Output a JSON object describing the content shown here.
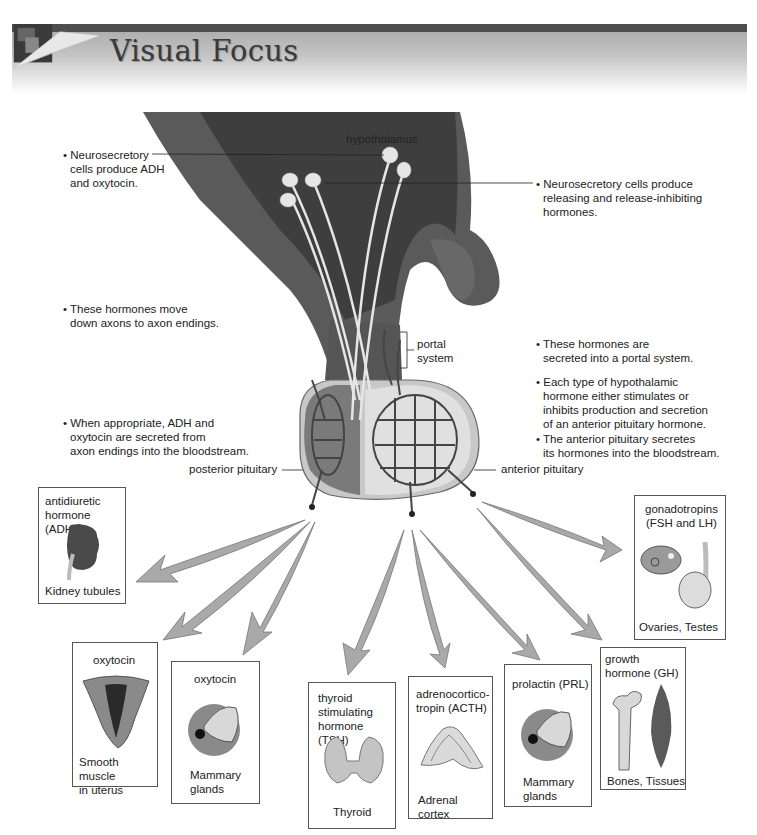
{
  "header": {
    "title": "Visual Focus",
    "colors": {
      "bar": "#4e4e4e",
      "gradient_top": "#a8a8a8",
      "title": "#3a3a3a"
    }
  },
  "diagram": {
    "structure_labels": {
      "hypothalamus": "hypothalamus",
      "portal_system_line1": "portal",
      "portal_system_line2": "system",
      "posterior_pituitary": "posterior pituitary",
      "anterior_pituitary": "anterior pituitary"
    },
    "annotations_left": [
      {
        "id": "neurosecretory-adh",
        "lines": [
          "• Neurosecretory",
          "cells produce ADH",
          "and oxytocin."
        ]
      },
      {
        "id": "move-down-axons",
        "lines": [
          "• These hormones move",
          "down axons to axon endings."
        ]
      },
      {
        "id": "adh-oxytocin-secreted",
        "lines": [
          "• When appropriate, ADH and",
          "oxytocin are secreted from",
          "axon endings into the bloodstream."
        ]
      }
    ],
    "annotations_right": [
      {
        "id": "neurosecretory-releasing",
        "lines": [
          "• Neurosecretory cells produce",
          "releasing and release-inhibiting",
          "hormones."
        ]
      },
      {
        "id": "portal-secretion",
        "lines": [
          "• These hormones are",
          "secreted into a portal system."
        ]
      },
      {
        "id": "stimulates-inhibits",
        "lines": [
          "• Each type of hypothalamic",
          "hormone either stimulates or",
          "inhibits production and secretion",
          "of an anterior pituitary hormone."
        ]
      },
      {
        "id": "anterior-secretes",
        "lines": [
          "• The anterior pituitary secretes",
          "its hormones into the bloodstream."
        ]
      }
    ],
    "colors": {
      "brain_tissue": "#5a5a5a",
      "brain_dark": "#3e3e3e",
      "gland_posterior": "#7a7a7a",
      "gland_anterior": "#d6d6d6",
      "vessels": "#444444",
      "arrow_fill": "#a9a9a9",
      "neuron": "#e6e6e6"
    }
  },
  "targets": [
    {
      "id": "adh",
      "hormone_lines": [
        "antidiuretic",
        "hormone (ADH)"
      ],
      "target_lines": [
        "Kidney tubules"
      ],
      "source": "posterior",
      "icon": "kidney-icon"
    },
    {
      "id": "oxytocin-uterus",
      "hormone_lines": [
        "oxytocin"
      ],
      "target_lines": [
        "Smooth muscle",
        "in uterus"
      ],
      "source": "posterior",
      "icon": "uterus-icon"
    },
    {
      "id": "oxytocin-mammary",
      "hormone_lines": [
        "oxytocin"
      ],
      "target_lines": [
        "Mammary",
        "glands"
      ],
      "source": "posterior",
      "icon": "mammary-gland-icon"
    },
    {
      "id": "tsh",
      "hormone_lines": [
        "thyroid",
        "stimulating",
        "hormone (TSH)"
      ],
      "target_lines": [
        "Thyroid"
      ],
      "source": "anterior",
      "icon": "thyroid-icon"
    },
    {
      "id": "acth",
      "hormone_lines": [
        "adrenocortico-",
        "tropin (ACTH)"
      ],
      "target_lines": [
        "Adrenal cortex"
      ],
      "source": "anterior",
      "icon": "adrenal-cortex-icon"
    },
    {
      "id": "prl",
      "hormone_lines": [
        "prolactin (PRL)"
      ],
      "target_lines": [
        "Mammary",
        "glands"
      ],
      "source": "anterior",
      "icon": "mammary-gland-icon"
    },
    {
      "id": "gh",
      "hormone_lines": [
        "growth",
        "hormone (GH)"
      ],
      "target_lines": [
        "Bones, Tissues"
      ],
      "source": "anterior",
      "icon": "bone-muscle-icon"
    },
    {
      "id": "gonadotropins",
      "hormone_lines": [
        "gonadotropins",
        "(FSH and LH)"
      ],
      "target_lines": [
        "Ovaries, Testes"
      ],
      "source": "anterior",
      "icon": "ovary-testis-icon"
    }
  ]
}
